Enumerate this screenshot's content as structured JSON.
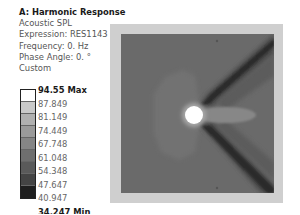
{
  "result": {
    "title": "A: Harmonic Response",
    "type": "Acoustic SPL",
    "expression": "Expression: RES1143",
    "frequency": "Frequency: 0. Hz",
    "phase_angle": "Phase Angle: 0. °",
    "scale": "Custom"
  },
  "legend": {
    "labels": [
      "94.55 Max",
      "87.849",
      "81.149",
      "74.449",
      "67.748",
      "61.048",
      "54.348",
      "47.647",
      "40.947",
      "34.247 Min"
    ],
    "band_colors": [
      "#ffffff",
      "#c9c9c9",
      "#b0b0b0",
      "#9a9a9a",
      "#858585",
      "#6f6f6f",
      "#5a5a5a",
      "#444444",
      "#1e1e1e"
    ]
  },
  "plot": {
    "border_color": "#cfcfcf",
    "field_color": "#6a6a6a",
    "source_color": "#ffffff",
    "lobe_color": "#858585",
    "near_field_color": "#707070",
    "shadow_color": "#2e2e2e"
  }
}
